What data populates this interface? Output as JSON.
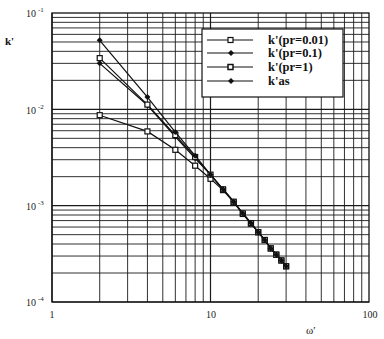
{
  "chart_data": {
    "type": "line",
    "title": "",
    "xlabel": "ω′",
    "ylabel": "k'",
    "xscale": "log",
    "yscale": "log",
    "xlim": [
      1,
      100
    ],
    "ylim": [
      0.0001,
      0.1
    ],
    "x_ticks": [
      "1",
      "10",
      "100"
    ],
    "y_ticks": [
      {
        "base": "10",
        "exp": "-1",
        "value": 0.1
      },
      {
        "base": "10",
        "exp": "-2",
        "value": 0.01
      },
      {
        "base": "10",
        "exp": "-3",
        "value": 0.001
      },
      {
        "base": "10",
        "exp": "-4",
        "value": 0.0001
      }
    ],
    "grid": true,
    "legend_position": "upper right (inside)",
    "series": [
      {
        "name": "k'(pr=0.01)",
        "marker": "square",
        "x": [
          2,
          4,
          6,
          8,
          10,
          12,
          14,
          16,
          18,
          20,
          22,
          24,
          26,
          28,
          30
        ],
        "values": [
          0.0087,
          0.0059,
          0.0038,
          0.0026,
          0.0019,
          0.00145,
          0.00108,
          0.00082,
          0.00065,
          0.00053,
          0.00044,
          0.00036,
          0.00031,
          0.00027,
          0.000235
        ]
      },
      {
        "name": "k'(pr=0.1)",
        "marker": "diamond",
        "x": [
          2,
          4,
          6,
          8,
          10,
          12,
          14,
          16,
          18,
          20,
          22,
          24,
          26,
          28,
          30
        ],
        "values": [
          0.03,
          0.011,
          0.0052,
          0.0031,
          0.0021,
          0.00148,
          0.0011,
          0.00083,
          0.00066,
          0.00053,
          0.00044,
          0.00036,
          0.00031,
          0.00027,
          0.000235
        ]
      },
      {
        "name": "k'(pr=1)",
        "marker": "square",
        "x": [
          2,
          4,
          6,
          8,
          10,
          12,
          14,
          16,
          18,
          20,
          22,
          24,
          26,
          28,
          30
        ],
        "values": [
          0.034,
          0.0112,
          0.0054,
          0.0032,
          0.0021,
          0.00148,
          0.0011,
          0.00083,
          0.00066,
          0.00053,
          0.00044,
          0.00036,
          0.00031,
          0.00027,
          0.000235
        ]
      },
      {
        "name": "k'as",
        "marker": "diamond",
        "x": [
          2,
          4,
          6,
          8,
          10,
          12,
          14,
          16,
          18,
          20,
          22,
          24,
          26,
          28,
          30
        ],
        "values": [
          0.052,
          0.0134,
          0.0058,
          0.0033,
          0.0021,
          0.00148,
          0.0011,
          0.00083,
          0.00066,
          0.00053,
          0.00044,
          0.00036,
          0.00031,
          0.00027,
          0.000235
        ]
      }
    ]
  },
  "colors": {
    "line": "#111111",
    "grid": "#1a1a1a",
    "background": "#ffffff"
  }
}
